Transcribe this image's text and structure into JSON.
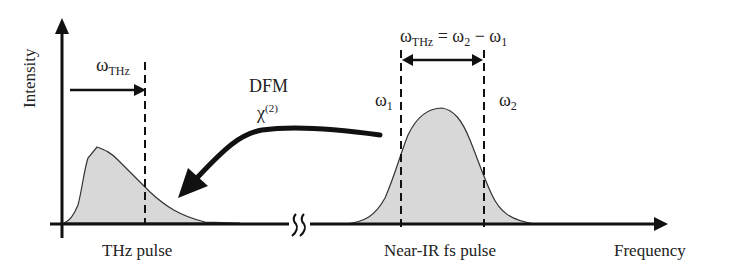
{
  "axes": {
    "y_label": "Intensity",
    "x_label": "Frequency",
    "axis_break_symbol": "double-squiggle"
  },
  "thz_pulse": {
    "label": "THz pulse",
    "omega_symbol": "ω",
    "omega_sub": "THz",
    "fill_color": "#d8d8d8"
  },
  "process": {
    "line1": "DFM",
    "chi_symbol": "χ",
    "chi_sup": "(2)"
  },
  "nir_pulse": {
    "label": "Near-IR fs pulse",
    "fill_color": "#d8d8d8",
    "omega1_symbol": "ω",
    "omega1_sub": "1",
    "omega2_symbol": "ω",
    "omega2_sub": "2",
    "equation": {
      "lhs_symbol": "ω",
      "lhs_sub": "THz",
      "equals": " = ",
      "term1_symbol": "ω",
      "term1_sub": "2",
      "minus": " − ",
      "term2_symbol": "ω",
      "term2_sub": "1"
    }
  },
  "colors": {
    "ink": "#111111",
    "fill": "#d8d8d8",
    "text": "#222222"
  }
}
